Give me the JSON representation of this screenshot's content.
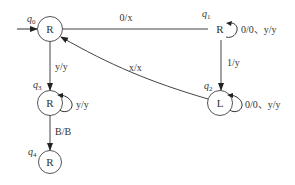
{
  "diagram": {
    "type": "turing-machine-state-diagram",
    "states": [
      {
        "id": "q0",
        "name": "q",
        "sub": "0",
        "label": "R",
        "initial": true,
        "circled": true
      },
      {
        "id": "q1",
        "name": "q",
        "sub": "1",
        "label": "R",
        "circled": false
      },
      {
        "id": "q2",
        "name": "q",
        "sub": "2",
        "label": "L",
        "circled": true
      },
      {
        "id": "q3",
        "name": "q",
        "sub": "3",
        "label": "R",
        "circled": true
      },
      {
        "id": "q4",
        "name": "q",
        "sub": "4",
        "label": "R",
        "circled": true
      }
    ],
    "transitions": [
      {
        "from": "q0",
        "to": "q1",
        "label": "0/x"
      },
      {
        "from": "q1",
        "to": "q1",
        "label": "0/0、y/y"
      },
      {
        "from": "q1",
        "to": "q2",
        "label": "1/y"
      },
      {
        "from": "q2",
        "to": "q2",
        "label": "0/0、y/y"
      },
      {
        "from": "q2",
        "to": "q0",
        "label": "x/x"
      },
      {
        "from": "q0",
        "to": "q3",
        "label": "y/y"
      },
      {
        "from": "q3",
        "to": "q3",
        "label": "y/y"
      },
      {
        "from": "q3",
        "to": "q4",
        "label": "B/B"
      }
    ]
  }
}
